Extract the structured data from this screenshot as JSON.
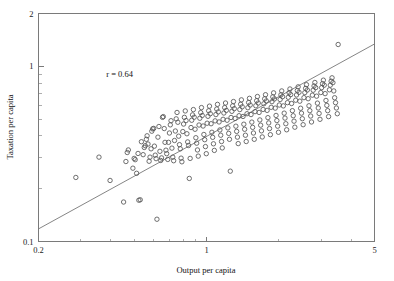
{
  "chart_data": {
    "type": "scatter",
    "title": "",
    "xlabel": "Output per capita",
    "ylabel": "Taxation per capita",
    "xscale": "log",
    "yscale": "log",
    "xlim": [
      0.2,
      5
    ],
    "ylim": [
      0.1,
      2
    ],
    "xticks": [
      0.2,
      1,
      5
    ],
    "xticklabels": [
      "0.2",
      "1",
      "5"
    ],
    "yticks": [
      0.1,
      1,
      2
    ],
    "yticklabels": [
      "0.1",
      "1",
      "2"
    ],
    "grid": false,
    "legend": "none",
    "annotations": [
      {
        "text": "r = 0.64",
        "x": 0.42,
        "y": 0.72
      }
    ],
    "marker": "open-circle",
    "fit_line": {
      "label": "regression-line",
      "x": [
        0.2,
        5.0
      ],
      "y": [
        0.118,
        1.34
      ]
    },
    "series": [
      {
        "name": "countries",
        "n": 251,
        "x": [
          0.286,
          0.357,
          0.397,
          0.452,
          0.462,
          0.468,
          0.473,
          0.494,
          0.5,
          0.505,
          0.512,
          0.519,
          0.523,
          0.53,
          0.536,
          0.545,
          0.551,
          0.556,
          0.562,
          0.566,
          0.571,
          0.577,
          0.582,
          0.588,
          0.592,
          0.597,
          0.603,
          0.607,
          0.612,
          0.617,
          0.622,
          0.628,
          0.634,
          0.64,
          0.645,
          0.65,
          0.656,
          0.661,
          0.667,
          0.672,
          0.678,
          0.683,
          0.69,
          0.695,
          0.701,
          0.707,
          0.712,
          0.718,
          0.724,
          0.73,
          0.736,
          0.742,
          0.748,
          0.754,
          0.76,
          0.766,
          0.772,
          0.778,
          0.784,
          0.79,
          0.797,
          0.803,
          0.809,
          0.816,
          0.822,
          0.829,
          0.835,
          0.842,
          0.848,
          0.855,
          0.862,
          0.868,
          0.875,
          0.882,
          0.889,
          0.896,
          0.903,
          0.91,
          0.917,
          0.924,
          0.931,
          0.938,
          0.946,
          0.953,
          0.96,
          0.968,
          0.975,
          0.983,
          0.99,
          0.998,
          1.006,
          1.014,
          1.021,
          1.029,
          1.037,
          1.045,
          1.053,
          1.061,
          1.069,
          1.078,
          1.086,
          1.094,
          1.103,
          1.111,
          1.12,
          1.128,
          1.137,
          1.146,
          1.155,
          1.163,
          1.172,
          1.181,
          1.19,
          1.2,
          1.209,
          1.218,
          1.227,
          1.237,
          1.246,
          1.256,
          1.265,
          1.275,
          1.285,
          1.295,
          1.305,
          1.315,
          1.325,
          1.335,
          1.345,
          1.355,
          1.366,
          1.376,
          1.387,
          1.397,
          1.408,
          1.419,
          1.43,
          1.441,
          1.452,
          1.463,
          1.474,
          1.486,
          1.497,
          1.509,
          1.52,
          1.532,
          1.544,
          1.556,
          1.568,
          1.58,
          1.592,
          1.604,
          1.617,
          1.629,
          1.642,
          1.655,
          1.667,
          1.68,
          1.693,
          1.706,
          1.72,
          1.733,
          1.746,
          1.76,
          1.774,
          1.787,
          1.801,
          1.815,
          1.829,
          1.844,
          1.858,
          1.872,
          1.887,
          1.902,
          1.917,
          1.932,
          1.947,
          1.962,
          1.977,
          1.993,
          2.008,
          2.024,
          2.04,
          2.056,
          2.072,
          2.088,
          2.105,
          2.121,
          2.138,
          2.155,
          2.172,
          2.189,
          2.206,
          2.224,
          2.241,
          2.259,
          2.277,
          2.295,
          2.313,
          2.331,
          2.35,
          2.369,
          2.387,
          2.406,
          2.426,
          2.445,
          2.464,
          2.484,
          2.504,
          2.524,
          2.544,
          2.565,
          2.585,
          2.606,
          2.627,
          2.648,
          2.669,
          2.691,
          2.713,
          2.735,
          2.757,
          2.779,
          2.802,
          2.824,
          2.847,
          2.871,
          2.894,
          2.918,
          2.941,
          2.966,
          2.99,
          3.014,
          3.039,
          3.064,
          3.09,
          3.115,
          3.141,
          3.167,
          3.193,
          3.22,
          3.247,
          3.274,
          3.301,
          3.329,
          3.357,
          3.385,
          3.413,
          3.442,
          3.471,
          3.501,
          3.53
        ],
        "y": [
          0.232,
          0.303,
          0.223,
          0.168,
          0.286,
          0.322,
          0.333,
          0.262,
          0.298,
          0.293,
          0.245,
          0.318,
          0.172,
          0.173,
          0.371,
          0.313,
          0.344,
          0.352,
          0.383,
          0.401,
          0.36,
          0.287,
          0.303,
          0.338,
          0.426,
          0.439,
          0.442,
          0.35,
          0.311,
          0.297,
          0.134,
          0.394,
          0.453,
          0.327,
          0.29,
          0.3,
          0.511,
          0.516,
          0.441,
          0.368,
          0.332,
          0.317,
          0.294,
          0.368,
          0.416,
          0.463,
          0.489,
          0.341,
          0.303,
          0.289,
          0.377,
          0.427,
          0.501,
          0.545,
          0.479,
          0.399,
          0.357,
          0.338,
          0.299,
          0.285,
          0.424,
          0.468,
          0.511,
          0.556,
          0.49,
          0.412,
          0.37,
          0.353,
          0.229,
          0.298,
          0.447,
          0.492,
          0.528,
          0.566,
          0.512,
          0.437,
          0.391,
          0.364,
          0.333,
          0.307,
          0.462,
          0.505,
          0.544,
          0.581,
          0.524,
          0.456,
          0.408,
          0.381,
          0.348,
          0.317,
          0.473,
          0.518,
          0.557,
          0.592,
          0.536,
          0.47,
          0.42,
          0.393,
          0.361,
          0.331,
          0.488,
          0.53,
          0.57,
          0.606,
          0.549,
          0.481,
          0.433,
          0.404,
          0.372,
          0.342,
          0.498,
          0.541,
          0.581,
          0.617,
          0.56,
          0.492,
          0.445,
          0.414,
          0.383,
          0.252,
          0.51,
          0.553,
          0.594,
          0.629,
          0.573,
          0.504,
          0.455,
          0.425,
          0.394,
          0.362,
          0.522,
          0.566,
          0.607,
          0.643,
          0.587,
          0.517,
          0.467,
          0.437,
          0.404,
          0.372,
          0.536,
          0.58,
          0.621,
          0.656,
          0.601,
          0.53,
          0.48,
          0.448,
          0.416,
          0.383,
          0.551,
          0.595,
          0.636,
          0.672,
          0.617,
          0.545,
          0.494,
          0.461,
          0.428,
          0.395,
          0.567,
          0.611,
          0.652,
          0.688,
          0.634,
          0.56,
          0.509,
          0.475,
          0.441,
          0.407,
          0.583,
          0.628,
          0.669,
          0.705,
          0.651,
          0.577,
          0.524,
          0.49,
          0.455,
          0.42,
          0.601,
          0.646,
          0.687,
          0.723,
          0.67,
          0.594,
          0.54,
          0.506,
          0.47,
          0.434,
          0.62,
          0.665,
          0.706,
          0.742,
          0.689,
          0.613,
          0.558,
          0.522,
          0.486,
          0.449,
          0.64,
          0.686,
          0.727,
          0.763,
          0.71,
          0.632,
          0.576,
          0.54,
          0.502,
          0.464,
          0.662,
          0.707,
          0.748,
          0.785,
          0.732,
          0.653,
          0.595,
          0.558,
          0.52,
          0.481,
          0.684,
          0.73,
          0.772,
          0.808,
          0.755,
          0.675,
          0.616,
          0.578,
          0.538,
          0.498,
          0.708,
          0.755,
          0.796,
          0.833,
          0.78,
          0.698,
          0.638,
          0.598,
          0.558,
          0.516,
          0.734,
          0.78,
          0.822,
          0.859,
          0.806,
          0.723,
          0.661,
          0.62,
          0.578,
          0.536,
          1.331
        ]
      }
    ]
  },
  "axes": {
    "x": {
      "label": "Output per capita",
      "ticklabels": [
        "0.2",
        "1",
        "5"
      ]
    },
    "y": {
      "label": "Taxation per capita",
      "ticklabels": [
        "2",
        "1",
        "0.1"
      ]
    }
  },
  "annotation": {
    "correlation": "r = 0.64"
  },
  "colors": {
    "axis": "#7a7a7a",
    "marker": "#555555",
    "line": "#777777",
    "background": "#ffffff",
    "text": "#111111"
  }
}
